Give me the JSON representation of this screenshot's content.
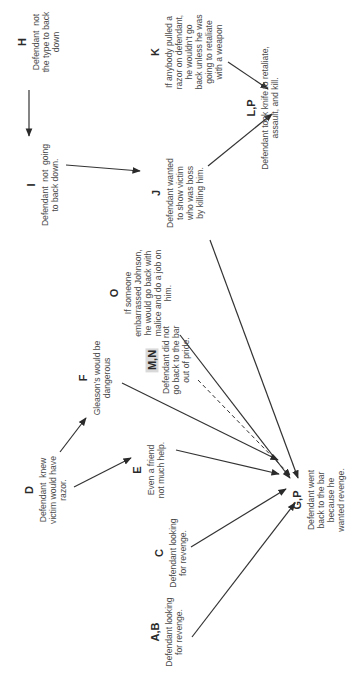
{
  "diagram": {
    "orientation": "rotated -90deg (text reads bottom-to-top)",
    "colors": {
      "line": "#333333",
      "text": "#4a4a4a",
      "highlight": "#d9d9d9"
    },
    "nodes": {
      "H": {
        "label": "H",
        "text": "Defendant  not\nthe type to back\ndown"
      },
      "I": {
        "label": "I",
        "text": "Defendant  not  going\nto back down."
      },
      "J": {
        "label": "J",
        "text": "Defendant wanted\nto show victim\nwho was boss\nby killing him."
      },
      "K": {
        "label": "K",
        "text": "If anybody pulled a\nrazor on defendant,\nhe wouldn't go\nback unless he was\ngoing to retaliate\nwith a weapon"
      },
      "LP": {
        "label": "L,P",
        "text": "Defendant took knife to retaliate,\nassault, and kill."
      },
      "O": {
        "label": "O",
        "text": "If someone\nembarrassed Johnson,\nhe would go back with\nmalice and do a job on\nhim."
      },
      "MN": {
        "label": "M,N",
        "text": "Defendant did not\ngo back to the bar\nout of pride."
      },
      "F": {
        "label": "F",
        "text": "Gleason's would be\ndangerous"
      },
      "D": {
        "label": "D",
        "text": "Defendant  knew\nvictim would have\nrazor."
      },
      "E": {
        "label": "E",
        "text": "Even a friend\nnot much help."
      },
      "C": {
        "label": "C",
        "text": "Defendant looking\nfor revenge."
      },
      "AB": {
        "label": "A,B",
        "text": "Defendant looking\nfor revenge."
      },
      "GP": {
        "label": "G,P",
        "text": "Defendant went\nback to the bar\nbecause he\nwanted revenge."
      }
    },
    "edges": [
      {
        "from": "H",
        "to": "I",
        "style": "solid"
      },
      {
        "from": "I",
        "to": "J",
        "style": "solid"
      },
      {
        "from": "J",
        "to": "LP",
        "style": "solid"
      },
      {
        "from": "K",
        "to": "LP",
        "style": "solid"
      },
      {
        "from": "J",
        "to": "GP",
        "style": "solid"
      },
      {
        "from": "O",
        "to": "GP",
        "style": "solid"
      },
      {
        "from": "MN",
        "to": "GP",
        "style": "dashed"
      },
      {
        "from": "F",
        "to": "GP",
        "style": "solid"
      },
      {
        "from": "D",
        "to": "F",
        "style": "solid"
      },
      {
        "from": "D",
        "to": "E",
        "style": "solid"
      },
      {
        "from": "E",
        "to": "GP",
        "style": "solid"
      },
      {
        "from": "C",
        "to": "GP",
        "style": "solid"
      },
      {
        "from": "AB",
        "to": "GP",
        "style": "solid"
      }
    ]
  }
}
